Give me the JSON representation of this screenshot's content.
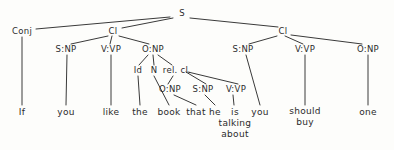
{
  "figure": {
    "name": "syntax-tree-diagram",
    "background_color": "#fdfdfb",
    "line_color": "#3a3a3a",
    "text_color": "#2b2b2b",
    "sentence": "If you like the book that he is talking about you should buy one"
  },
  "nodes": [
    {
      "id": "s",
      "label": "S",
      "x": 182,
      "y": 13,
      "kind": "category"
    },
    {
      "id": "conj",
      "label": "Conj",
      "x": 22,
      "y": 31,
      "kind": "category"
    },
    {
      "id": "cl1",
      "label": "Cl",
      "x": 113,
      "y": 31,
      "kind": "category"
    },
    {
      "id": "cl2",
      "label": "Cl",
      "x": 283,
      "y": 31,
      "kind": "category"
    },
    {
      "id": "c1snp",
      "label": "S:NP",
      "x": 66,
      "y": 49,
      "kind": "category"
    },
    {
      "id": "c1vvp",
      "label": "V:VP",
      "x": 111,
      "y": 49,
      "kind": "category"
    },
    {
      "id": "c1onp",
      "label": "O:NP",
      "x": 153,
      "y": 49,
      "kind": "category"
    },
    {
      "id": "c2snp",
      "label": "S:NP",
      "x": 243,
      "y": 49,
      "kind": "category"
    },
    {
      "id": "c2vvp",
      "label": "V:VP",
      "x": 305,
      "y": 49,
      "kind": "category"
    },
    {
      "id": "c2onp",
      "label": "O:NP",
      "x": 368,
      "y": 49,
      "kind": "category"
    },
    {
      "id": "id",
      "label": "Id",
      "x": 138,
      "y": 70,
      "kind": "category"
    },
    {
      "id": "n",
      "label": "N",
      "x": 154,
      "y": 70,
      "kind": "category"
    },
    {
      "id": "relcl",
      "label": "rel. cl.",
      "x": 177,
      "y": 70,
      "kind": "category"
    },
    {
      "id": "ronp",
      "label": "O:NP",
      "x": 170,
      "y": 89,
      "kind": "category"
    },
    {
      "id": "rsnp",
      "label": "S:NP",
      "x": 203,
      "y": 89,
      "kind": "category"
    },
    {
      "id": "rvvp",
      "label": "V:VP",
      "x": 236,
      "y": 89,
      "kind": "category"
    },
    {
      "id": "w-if",
      "label": "If",
      "x": 22,
      "y": 112,
      "kind": "leaf"
    },
    {
      "id": "w-you1",
      "label": "you",
      "x": 66,
      "y": 112,
      "kind": "leaf"
    },
    {
      "id": "w-like",
      "label": "like",
      "x": 111,
      "y": 112,
      "kind": "leaf"
    },
    {
      "id": "w-the",
      "label": "the",
      "x": 140,
      "y": 112,
      "kind": "leaf"
    },
    {
      "id": "w-book",
      "label": "book",
      "x": 169,
      "y": 112,
      "kind": "leaf"
    },
    {
      "id": "w-that",
      "label": "that",
      "x": 196,
      "y": 112,
      "kind": "leaf"
    },
    {
      "id": "w-he",
      "label": "he",
      "x": 215,
      "y": 112,
      "kind": "leaf"
    },
    {
      "id": "w-is",
      "label": "is\ntalking\nabout",
      "x": 235,
      "y": 123,
      "kind": "leaf"
    },
    {
      "id": "w-you2",
      "label": "you",
      "x": 260,
      "y": 112,
      "kind": "leaf"
    },
    {
      "id": "w-should",
      "label": "should\nbuy",
      "x": 305,
      "y": 117,
      "kind": "leaf"
    },
    {
      "id": "w-one",
      "label": "one",
      "x": 368,
      "y": 112,
      "kind": "leaf"
    }
  ],
  "edges": [
    {
      "from": "s",
      "to": "conj",
      "x1": 170,
      "y1": 17,
      "x2": 36,
      "y2": 29
    },
    {
      "from": "s",
      "to": "cl1",
      "x1": 173,
      "y1": 18,
      "x2": 122,
      "y2": 28
    },
    {
      "from": "s",
      "to": "cl2",
      "x1": 190,
      "y1": 18,
      "x2": 278,
      "y2": 27
    },
    {
      "from": "conj",
      "to": "w-if",
      "x1": 22,
      "y1": 37,
      "x2": 22,
      "y2": 105
    },
    {
      "from": "cl1",
      "to": "c1snp",
      "x1": 108,
      "y1": 36,
      "x2": 71,
      "y2": 44
    },
    {
      "from": "cl1",
      "to": "c1vvp",
      "x1": 112,
      "y1": 36,
      "x2": 110,
      "y2": 44
    },
    {
      "from": "cl1",
      "to": "c1onp",
      "x1": 119,
      "y1": 36,
      "x2": 149,
      "y2": 44
    },
    {
      "from": "c1snp",
      "to": "w-you1",
      "x1": 67,
      "y1": 55,
      "x2": 66,
      "y2": 105
    },
    {
      "from": "c1vvp",
      "to": "w-like",
      "x1": 111,
      "y1": 55,
      "x2": 111,
      "y2": 105
    },
    {
      "from": "c1onp",
      "to": "id",
      "x1": 148,
      "y1": 55,
      "x2": 139,
      "y2": 65
    },
    {
      "from": "c1onp",
      "to": "n",
      "x1": 153,
      "y1": 55,
      "x2": 154,
      "y2": 65
    },
    {
      "from": "c1onp",
      "to": "relcl",
      "x1": 158,
      "y1": 55,
      "x2": 172,
      "y2": 65
    },
    {
      "from": "id",
      "to": "w-the",
      "x1": 138,
      "y1": 76,
      "x2": 140,
      "y2": 105
    },
    {
      "from": "n",
      "to": "w-book",
      "x1": 154,
      "y1": 76,
      "x2": 169,
      "y2": 105
    },
    {
      "from": "relcl",
      "to": "ronp",
      "x1": 173,
      "y1": 76,
      "x2": 168,
      "y2": 84
    },
    {
      "from": "relcl",
      "to": "rsnp",
      "x1": 186,
      "y1": 72,
      "x2": 206,
      "y2": 84
    },
    {
      "from": "relcl",
      "to": "rvvp",
      "x1": 188,
      "y1": 72,
      "x2": 238,
      "y2": 84
    },
    {
      "from": "ronp",
      "to": "w-that",
      "x1": 174,
      "y1": 95,
      "x2": 196,
      "y2": 105
    },
    {
      "from": "rsnp",
      "to": "w-he",
      "x1": 205,
      "y1": 95,
      "x2": 215,
      "y2": 105
    },
    {
      "from": "rvvp",
      "to": "w-is",
      "x1": 233,
      "y1": 95,
      "x2": 234,
      "y2": 105
    },
    {
      "from": "cl2",
      "to": "c2snp",
      "x1": 277,
      "y1": 36,
      "x2": 249,
      "y2": 44
    },
    {
      "from": "cl2",
      "to": "c2vvp",
      "x1": 285,
      "y1": 36,
      "x2": 303,
      "y2": 44
    },
    {
      "from": "cl2",
      "to": "c2onp",
      "x1": 291,
      "y1": 35,
      "x2": 362,
      "y2": 44
    },
    {
      "from": "c2snp",
      "to": "w-you2",
      "x1": 246,
      "y1": 55,
      "x2": 260,
      "y2": 105
    },
    {
      "from": "c2vvp",
      "to": "w-should",
      "x1": 305,
      "y1": 55,
      "x2": 305,
      "y2": 105
    },
    {
      "from": "c2onp",
      "to": "w-one",
      "x1": 368,
      "y1": 55,
      "x2": 368,
      "y2": 105
    }
  ]
}
